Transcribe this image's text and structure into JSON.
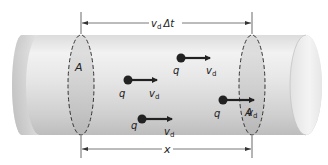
{
  "diagram": {
    "top_dimension": {
      "symbol": "v",
      "subscript": "d",
      "suffix": "Δt"
    },
    "bottom_dimension": {
      "label": "x"
    },
    "cross_sections": [
      {
        "label": "A",
        "position": "left"
      },
      {
        "label": "A",
        "position": "right"
      }
    ],
    "charges": [
      {
        "label": "q",
        "velocity_symbol": "v",
        "velocity_subscript": "d"
      },
      {
        "label": "q",
        "velocity_symbol": "v",
        "velocity_subscript": "d"
      },
      {
        "label": "q",
        "velocity_symbol": "v",
        "velocity_subscript": "d"
      },
      {
        "label": "q",
        "velocity_symbol": "v",
        "velocity_subscript": "d"
      }
    ],
    "colors": {
      "cylinder_light": "#f4f4f4",
      "cylinder_mid": "#d6d6d6",
      "cylinder_dark": "#b8b8b8",
      "ellipse_fill": "#c8c8c8",
      "ink": "#222222",
      "dimension_line": "#555555"
    }
  }
}
